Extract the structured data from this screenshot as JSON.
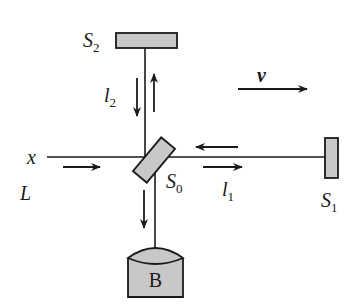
{
  "diagram": {
    "type": "michelson-interferometer",
    "labels": {
      "mirror_top": {
        "main": "S",
        "sub": "2"
      },
      "mirror_right": {
        "main": "S",
        "sub": "1"
      },
      "splitter": {
        "main": "S",
        "sub": "0"
      },
      "arm_vertical": {
        "main": "l",
        "sub": "2"
      },
      "arm_horizontal": {
        "main": "l",
        "sub": "1"
      },
      "velocity": "v",
      "axis": "x",
      "source": "L",
      "detector": "B"
    },
    "colors": {
      "component_fill": "#c8c8c8",
      "stroke": "#1a1a1a",
      "background": "#ffffff"
    }
  }
}
